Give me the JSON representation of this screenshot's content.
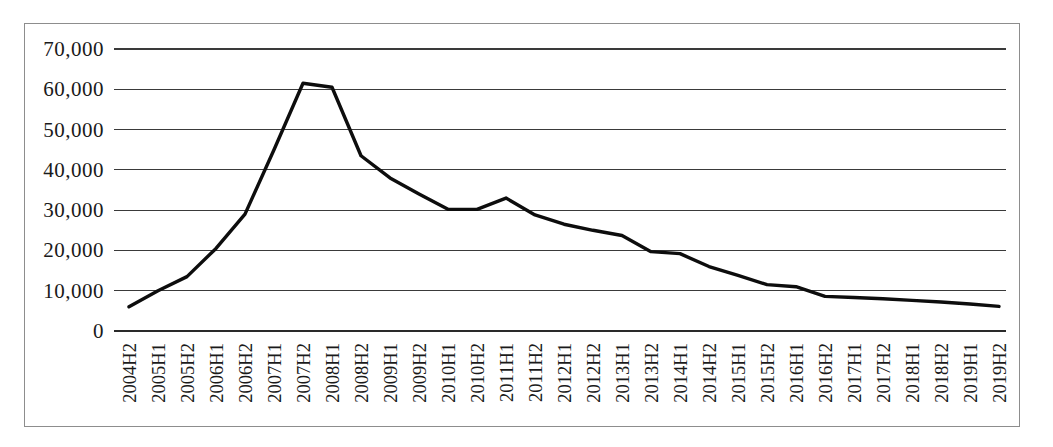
{
  "chart_data": {
    "type": "line",
    "title": "",
    "subtitle": "",
    "xlabel": "",
    "ylabel": "",
    "grid": true,
    "legend": "none",
    "ylim": [
      0,
      70000
    ],
    "ytick_step": 10000,
    "ytick_labels": [
      "70,000",
      "60,000",
      "50,000",
      "40,000",
      "30,000",
      "20,000",
      "10,000",
      "0"
    ],
    "ytick_values": [
      70000,
      60000,
      50000,
      40000,
      30000,
      20000,
      10000,
      0
    ],
    "categories": [
      "2004H2",
      "2005H1",
      "2005H2",
      "2006H1",
      "2006H2",
      "2007H1",
      "2007H2",
      "2008H1",
      "2008H2",
      "2009H1",
      "2009H2",
      "2010H1",
      "2010H2",
      "2011H1",
      "2011H2",
      "2012H1",
      "2012H2",
      "2013H1",
      "2013H2",
      "2014H1",
      "2014H2",
      "2015H1",
      "2015H2",
      "2016H1",
      "2016H2",
      "2017H1",
      "2017H2",
      "2018H1",
      "2018H2",
      "2019H1",
      "2019H2"
    ],
    "series": [
      {
        "name": "series-1",
        "color": "#0d0d0d",
        "values": [
          6000,
          10000,
          13500,
          20500,
          29000,
          45000,
          61500,
          60500,
          43500,
          38000,
          34000,
          30200,
          30200,
          33000,
          28800,
          26500,
          25000,
          23700,
          19700,
          19200,
          16000,
          13800,
          11500,
          11000,
          8600,
          8300,
          8000,
          7600,
          7200,
          6700,
          6100
        ]
      }
    ]
  },
  "figure": {
    "background_color": "#ffffff",
    "border_color": "#8d8d8d",
    "line_color": "#0d0d0d",
    "grid_color": "#3a3a3a"
  }
}
